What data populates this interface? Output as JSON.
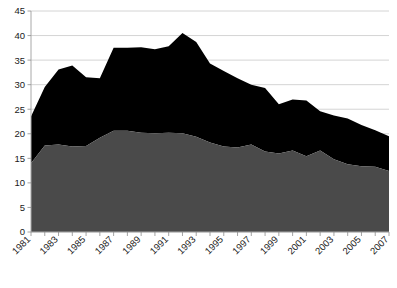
{
  "chart_data": {
    "type": "area",
    "stacked": true,
    "title": "",
    "subtitle": "",
    "xlabel": "",
    "ylabel": "",
    "xlim": [
      1981,
      2007
    ],
    "ylim": [
      0,
      45
    ],
    "ytick_step": 5,
    "grid": true,
    "legend": "none",
    "x": [
      1981,
      1982,
      1983,
      1984,
      1985,
      1986,
      1987,
      1988,
      1989,
      1990,
      1991,
      1992,
      1993,
      1994,
      1995,
      1996,
      1997,
      1998,
      1999,
      2000,
      2001,
      2002,
      2003,
      2004,
      2005,
      2006,
      2007
    ],
    "xtick_labels": [
      "1981",
      "1983",
      "1985",
      "1987",
      "1989",
      "1991",
      "1993",
      "1995",
      "1997",
      "1999",
      "2001",
      "2003",
      "2005",
      "2007"
    ],
    "ytick_labels": [
      "0",
      "5",
      "10",
      "15",
      "20",
      "25",
      "30",
      "35",
      "40",
      "45"
    ],
    "ytick_values": [
      0,
      5,
      10,
      15,
      20,
      25,
      30,
      35,
      40,
      45
    ],
    "series": [
      {
        "name": "lower-series",
        "color": "#4a4a4a",
        "values": [
          14.0,
          17.6,
          17.8,
          17.4,
          17.5,
          19.2,
          20.6,
          20.6,
          20.2,
          20.1,
          20.2,
          20.1,
          19.4,
          18.2,
          17.4,
          17.2,
          17.8,
          16.4,
          16.0,
          16.6,
          15.4,
          16.6,
          14.8,
          13.8,
          13.4,
          13.3,
          12.4
        ]
      },
      {
        "name": "upper-series",
        "color": "#000000",
        "values": [
          9.5,
          11.9,
          15.3,
          16.5,
          14.0,
          12.1,
          16.9,
          16.9,
          17.4,
          17.1,
          17.6,
          20.4,
          19.3,
          16.1,
          15.4,
          14.1,
          12.2,
          12.9,
          10.0,
          10.4,
          11.4,
          8.0,
          8.9,
          9.3,
          8.4,
          7.4,
          7.1
        ]
      }
    ],
    "totals": [
      23.5,
      29.5,
      33.1,
      33.9,
      31.5,
      31.3,
      37.5,
      37.5,
      37.6,
      37.2,
      37.8,
      40.5,
      38.7,
      34.3,
      32.8,
      31.3,
      30.0,
      29.3,
      26.0,
      27.0,
      26.8,
      24.6,
      23.7,
      23.1,
      21.8,
      20.7,
      19.5
    ]
  }
}
